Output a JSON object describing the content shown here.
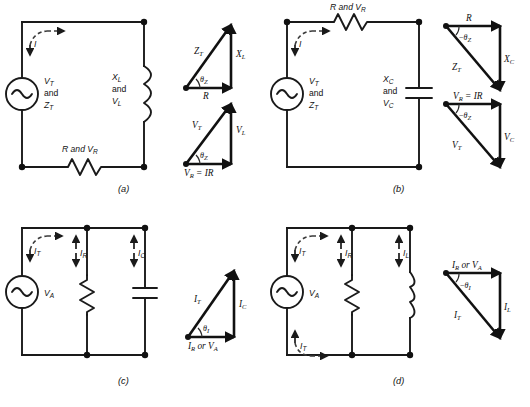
{
  "figure": {
    "background_color": "#ffffff",
    "line_color": "#1a1a1a",
    "dash_color": "#3a3a3a"
  },
  "panels": [
    {
      "id": "a",
      "caption": "(a)",
      "description": "Series RL circuit",
      "source_label_lines": [
        "V",
        "and",
        "Z"
      ],
      "source_line1": "V",
      "source_line1_sub": "T",
      "source_line2": "and",
      "source_line3": "Z",
      "source_line3_sub": "T",
      "reactive_line1": "X",
      "reactive_line1_sub": "L",
      "reactive_line2": "and",
      "reactive_line3": "V",
      "reactive_line3_sub": "L",
      "resistor_label": "R and V",
      "resistor_label_sub": "R",
      "current_label": "I",
      "triangles": [
        {
          "name": "impedance-triangle",
          "hypotenuse": "Z",
          "hypotenuse_sub": "T",
          "vertical": "X",
          "vertical_sub": "L",
          "base": "R",
          "base_sub": "",
          "angle": "θ",
          "angle_sub": "Z",
          "angle_sign": ""
        },
        {
          "name": "voltage-triangle",
          "hypotenuse": "V",
          "hypotenuse_sub": "T",
          "vertical": "V",
          "vertical_sub": "L",
          "base": "V",
          "base_sub": "R",
          "base_suffix": " = IR",
          "angle": "θ",
          "angle_sub": "Z",
          "angle_sign": ""
        }
      ]
    },
    {
      "id": "b",
      "caption": "(b)",
      "description": "Series RC circuit",
      "source_line1": "V",
      "source_line1_sub": "T",
      "source_line2": "and",
      "source_line3": "Z",
      "source_line3_sub": "T",
      "reactive_line1": "X",
      "reactive_line1_sub": "C",
      "reactive_line2": "and",
      "reactive_line3": "V",
      "reactive_line3_sub": "C",
      "resistor_label": "R and V",
      "resistor_label_sub": "R",
      "current_label": "I",
      "triangles": [
        {
          "name": "impedance-triangle",
          "hypotenuse": "Z",
          "hypotenuse_sub": "T",
          "vertical": "X",
          "vertical_sub": "C",
          "base": "R",
          "base_sub": "",
          "angle": "θ",
          "angle_sub": "Z",
          "angle_sign": "−"
        },
        {
          "name": "voltage-triangle",
          "hypotenuse": "V",
          "hypotenuse_sub": "T",
          "vertical": "V",
          "vertical_sub": "C",
          "base": "V",
          "base_sub": "R",
          "base_suffix": " = IR",
          "angle": "θ",
          "angle_sub": "Z",
          "angle_sign": "−"
        }
      ]
    },
    {
      "id": "c",
      "caption": "(c)",
      "description": "Parallel RC circuit",
      "source_label": "V",
      "source_label_sub": "A",
      "branch_currents": [
        {
          "label": "I",
          "sub": "T"
        },
        {
          "label": "I",
          "sub": "R"
        },
        {
          "label": "I",
          "sub": "C"
        }
      ],
      "triangles": [
        {
          "name": "current-triangle",
          "hypotenuse": "I",
          "hypotenuse_sub": "T",
          "vertical": "I",
          "vertical_sub": "C",
          "base": "I",
          "base_sub": "R",
          "base_suffix": " or V",
          "base_suffix_sub": "A",
          "angle": "θ",
          "angle_sub": "I",
          "angle_sign": ""
        }
      ]
    },
    {
      "id": "d",
      "caption": "(d)",
      "description": "Parallel RL circuit",
      "source_label": "V",
      "source_label_sub": "A",
      "branch_currents": [
        {
          "label": "I",
          "sub": "T"
        },
        {
          "label": "I",
          "sub": "R"
        },
        {
          "label": "I",
          "sub": "L"
        }
      ],
      "extra_current": {
        "label": "I",
        "sub": "T"
      },
      "triangles": [
        {
          "name": "current-triangle",
          "hypotenuse": "I",
          "hypotenuse_sub": "T",
          "vertical": "I",
          "vertical_sub": "L",
          "base": "I",
          "base_sub": "R",
          "base_suffix": " or V",
          "base_suffix_sub": "A",
          "angle": "θ",
          "angle_sub": "I",
          "angle_sign": "−"
        }
      ]
    }
  ]
}
